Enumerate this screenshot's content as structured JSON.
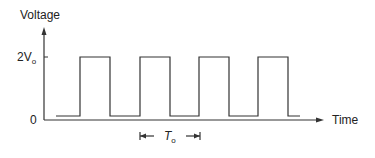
{
  "diagram": {
    "type": "square-wave",
    "y_axis_label": "Voltage",
    "x_axis_label": "Time",
    "y_ticks": [
      {
        "label_main": "2V",
        "label_sub": "o",
        "level": "high"
      },
      {
        "label_main": "0",
        "label_sub": "",
        "level": "zero"
      }
    ],
    "period_label_main": "T",
    "period_label_sub": "o",
    "pulse_count": 4,
    "line_color": "#333333"
  }
}
